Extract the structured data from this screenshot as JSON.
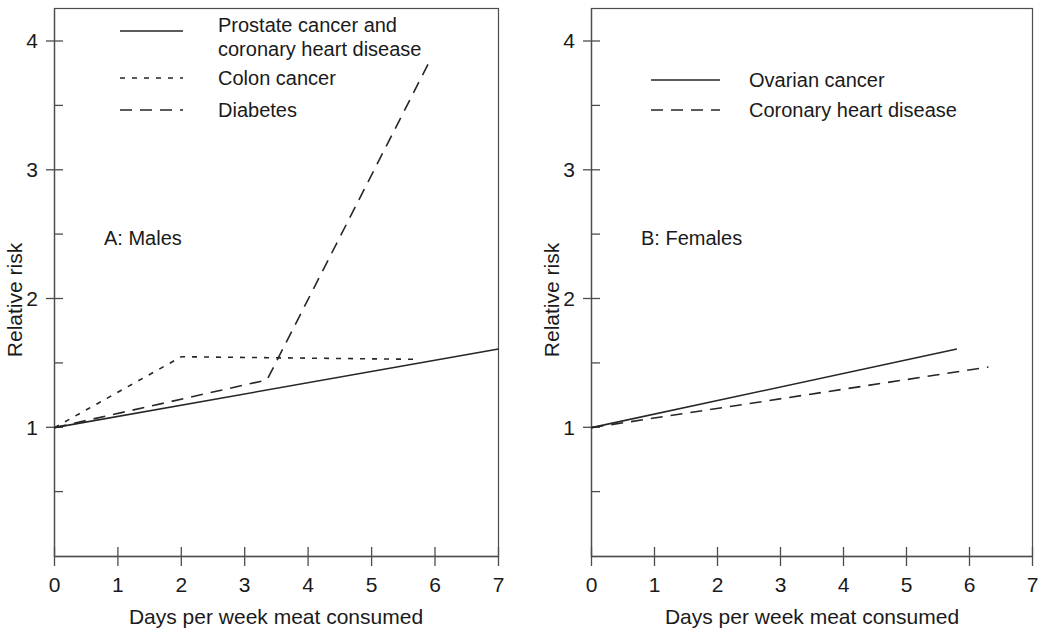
{
  "figure": {
    "background_color": "#ffffff",
    "line_color": "#262626",
    "axis_color": "#4d4d4d"
  },
  "chart_data": [
    {
      "type": "line",
      "panel_id": "A",
      "panel_label": "A: Males",
      "title": "",
      "xlabel": "Days per week meat consumed",
      "ylabel": "Relative risk",
      "xlim": [
        0,
        7
      ],
      "ylim": [
        0,
        4.3
      ],
      "xticks": [
        "0",
        "1",
        "2",
        "3",
        "4",
        "5",
        "6",
        "7"
      ],
      "xtick_values": [
        0,
        1,
        2,
        3,
        4,
        5,
        6,
        7
      ],
      "yticks": [
        "1",
        "2",
        "3",
        "4"
      ],
      "ytick_values": [
        1,
        2,
        3,
        4
      ],
      "yminor_values": [
        0.5,
        1.5,
        2.5,
        3.5
      ],
      "grid": false,
      "legend_position": "top-center",
      "series": [
        {
          "name": "Prostate cancer and coronary heart disease",
          "legend_lines": [
            "Prostate cancer and",
            "coronary heart disease"
          ],
          "style": "solid",
          "x": [
            0,
            7
          ],
          "y": [
            1.0,
            1.61
          ]
        },
        {
          "name": "Colon cancer",
          "legend_lines": [
            "Colon cancer"
          ],
          "style": "dotted",
          "x": [
            0,
            2,
            5.7
          ],
          "y": [
            1.0,
            1.55,
            1.53
          ]
        },
        {
          "name": "Diabetes",
          "legend_lines": [
            "Diabetes"
          ],
          "style": "dashed",
          "x": [
            0,
            3.35,
            5.9
          ],
          "y": [
            1.0,
            1.37,
            3.83
          ]
        }
      ]
    },
    {
      "type": "line",
      "panel_id": "B",
      "panel_label": "B: Females",
      "title": "",
      "xlabel": "Days per week meat consumed",
      "ylabel": "Relative risk",
      "xlim": [
        0,
        7
      ],
      "ylim": [
        0,
        4.3
      ],
      "xticks": [
        "0",
        "1",
        "2",
        "3",
        "4",
        "5",
        "6",
        "7"
      ],
      "xtick_values": [
        0,
        1,
        2,
        3,
        4,
        5,
        6,
        7
      ],
      "yticks": [
        "1",
        "2",
        "3",
        "4"
      ],
      "ytick_values": [
        1,
        2,
        3,
        4
      ],
      "yminor_values": [
        0.5,
        1.5,
        2.5,
        3.5
      ],
      "grid": false,
      "legend_position": "top-center",
      "series": [
        {
          "name": "Ovarian cancer",
          "legend_lines": [
            "Ovarian cancer"
          ],
          "style": "solid",
          "x": [
            0,
            5.8
          ],
          "y": [
            1.0,
            1.61
          ]
        },
        {
          "name": "Coronary heart disease",
          "legend_lines": [
            "Coronary heart disease"
          ],
          "style": "dashed",
          "x": [
            0,
            6.3
          ],
          "y": [
            1.0,
            1.47
          ]
        }
      ]
    }
  ]
}
